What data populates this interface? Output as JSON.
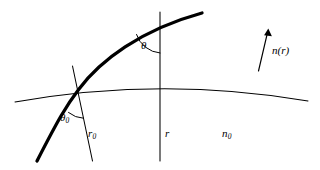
{
  "figure": {
    "name": "ray-refraction-diagram",
    "background_color": "#ffffff",
    "stroke_color": "#000000",
    "thick_stroke_width": 3.2,
    "thin_stroke_width": 1.0
  },
  "labels": {
    "theta0": {
      "symbol": "θ",
      "subscript": "0"
    },
    "r0": {
      "symbol": "r",
      "subscript": "0"
    },
    "theta": {
      "symbol": "θ",
      "subscript": ""
    },
    "r": {
      "symbol": "r",
      "subscript": ""
    },
    "n0": {
      "symbol": "n",
      "subscript": "0"
    },
    "nr": {
      "symbol": "n",
      "argument": "(r)"
    }
  },
  "elements": {
    "ray_curve": "thick-curved-light-ray",
    "boundary_arc": "thin-curved-surface-arc",
    "radial_line_r0": "thin-radial-line-r0",
    "radial_line_r": "thin-vertical-radial-line-r",
    "angle_arc_theta0": "arc-between-ray-and-r0",
    "angle_arc_theta": "arc-between-ray-and-r",
    "gradient_arrow": "index-gradient-arrow"
  }
}
